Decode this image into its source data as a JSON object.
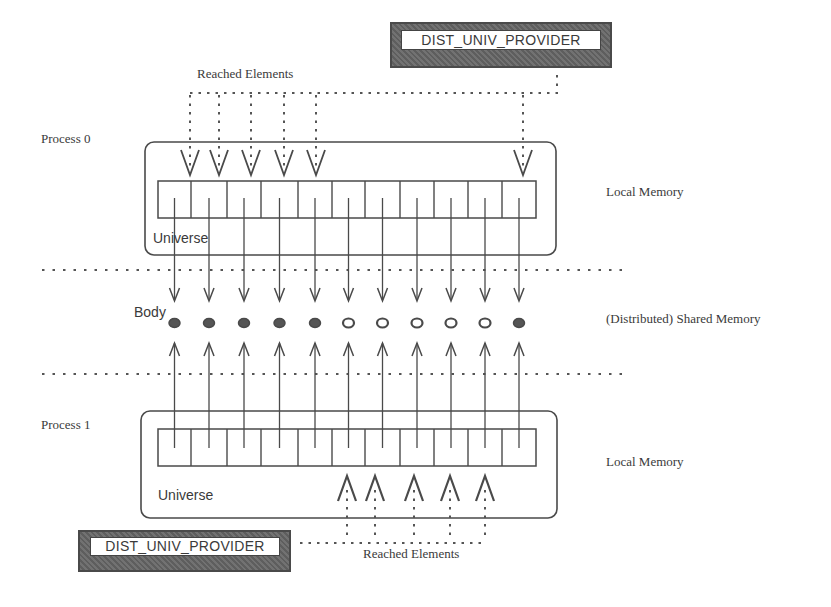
{
  "diagram": {
    "type": "distributed-memory-architecture",
    "cell_count": 11,
    "colors": {
      "stroke": "#4a4a4a",
      "dotted": "#555555",
      "body_filled": "#555555",
      "body_hollow": "#ffffff",
      "provider_fill": "#6b6b6b"
    },
    "process0": {
      "label": "Process 0",
      "universe_label": "Universe",
      "memory_label": "Local Memory",
      "provider_label": "DIST_UNIV_PROVIDER",
      "reached_label": "Reached Elements",
      "reached_cell_indices": [
        0,
        1,
        2,
        3,
        4,
        10
      ]
    },
    "shared": {
      "body_label": "Body",
      "memory_label": "(Distributed) Shared Memory",
      "bodies": [
        {
          "index": 0,
          "state": "filled"
        },
        {
          "index": 1,
          "state": "filled"
        },
        {
          "index": 2,
          "state": "filled"
        },
        {
          "index": 3,
          "state": "filled"
        },
        {
          "index": 4,
          "state": "filled"
        },
        {
          "index": 5,
          "state": "hollow"
        },
        {
          "index": 6,
          "state": "hollow"
        },
        {
          "index": 7,
          "state": "hollow"
        },
        {
          "index": 8,
          "state": "hollow"
        },
        {
          "index": 9,
          "state": "hollow"
        },
        {
          "index": 10,
          "state": "filled"
        }
      ]
    },
    "process1": {
      "label": "Process 1",
      "universe_label": "Universe",
      "memory_label": "Local Memory",
      "provider_label": "DIST_UNIV_PROVIDER",
      "reached_label": "Reached Elements",
      "reached_cell_indices": [
        5,
        6,
        7,
        8,
        9
      ]
    }
  }
}
